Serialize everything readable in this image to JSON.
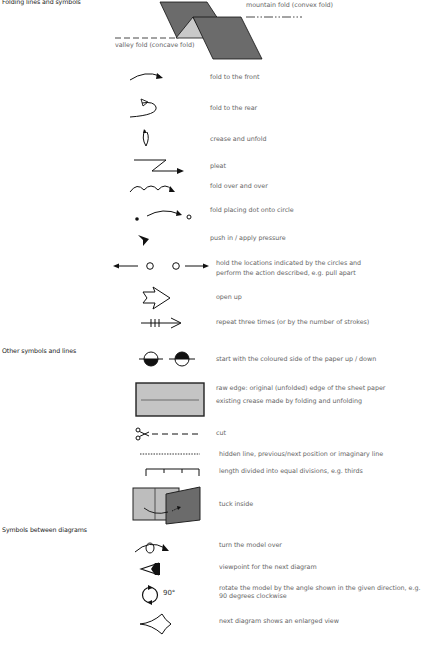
{
  "sections": {
    "folding": "Folding lines and symbols",
    "other": "Other symbols and lines",
    "between": "Symbols between diagrams"
  },
  "header_diagram": {
    "mountain_label": "mountain fold (convex fold)",
    "valley_label": "valley fold (concave fold)"
  },
  "folding_items": [
    {
      "icon": "fold-front-arrow-icon",
      "label": "fold to the front"
    },
    {
      "icon": "fold-rear-arrow-icon",
      "label": "fold to the rear"
    },
    {
      "icon": "crease-unfold-arrow-icon",
      "label": "crease and unfold"
    },
    {
      "icon": "pleat-arrow-icon",
      "label": "pleat"
    },
    {
      "icon": "fold-over-and-over-icon",
      "label": "fold over and over"
    },
    {
      "icon": "dot-to-circle-icon",
      "label": "fold placing dot onto circle"
    },
    {
      "icon": "push-in-arrow-icon",
      "label": "push in / apply pressure"
    },
    {
      "icon": "hold-pull-apart-icon",
      "label_lines": [
        "hold the locations indicated by the circles and",
        "perform the action described, e.g. pull apart"
      ]
    },
    {
      "icon": "open-up-arrow-icon",
      "label": "open up"
    },
    {
      "icon": "repeat-arrow-icon",
      "label": "repeat three times (or by the number of strokes)"
    }
  ],
  "other_items": [
    {
      "icon": "coloured-side-up-down-icon",
      "label": "start with the coloured side of the paper up / down"
    },
    {
      "icon": "raw-edge-rectangle-icon",
      "label": "raw edge: original (unfolded) edge of the sheet paper"
    },
    {
      "icon": "existing-crease-line-icon",
      "label": "existing crease made by folding and unfolding"
    },
    {
      "icon": "scissors-cut-icon",
      "label": "cut"
    },
    {
      "icon": "hidden-line-icon",
      "label": "hidden line, previous/next position or imaginary line"
    },
    {
      "icon": "equal-divisions-icon",
      "label": "length divided into equal divisions, e.g. thirds"
    },
    {
      "icon": "tuck-inside-icon",
      "label": "tuck inside"
    }
  ],
  "between_items": [
    {
      "icon": "turn-over-icon",
      "label": "turn the model over"
    },
    {
      "icon": "viewpoint-eye-icon",
      "label": "viewpoint for the next diagram"
    },
    {
      "icon": "rotate-icon",
      "angle": "90°",
      "label_lines": [
        "rotate the model by the angle shown in the given direction, e.g.",
        "90 degrees clockwise"
      ]
    },
    {
      "icon": "enlarged-view-icon",
      "label": "next diagram shows an enlarged view"
    }
  ],
  "colors": {
    "paper_dark": "#6b6b6b",
    "paper_light": "#bdbdbd",
    "paper_inner": "#c9c9c9",
    "stroke": "#111111",
    "text": "#666666"
  }
}
